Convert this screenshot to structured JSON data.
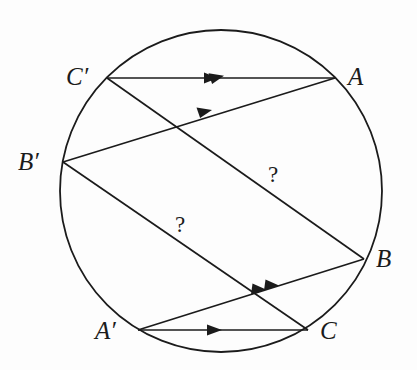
{
  "figure": {
    "background_color": "#fdfdfd",
    "stroke_color": "#1b1b1b",
    "circle": {
      "name": "circumscribed-circle",
      "cx": 221,
      "cy": 191,
      "r": 161,
      "stroke_width": 1.8
    },
    "points": [
      {
        "id": "A",
        "label": "A",
        "x": 335,
        "y": 78,
        "label_x": 348,
        "label_y": 64
      },
      {
        "id": "B",
        "label": "B",
        "x": 364,
        "y": 259,
        "label_x": 376,
        "label_y": 246
      },
      {
        "id": "C",
        "label": "C",
        "x": 308,
        "y": 330,
        "label_x": 320,
        "label_y": 318
      },
      {
        "id": "Ap",
        "label": "A′",
        "x": 138,
        "y": 330,
        "label_x": 95,
        "label_y": 318
      },
      {
        "id": "Bp",
        "label": "B′",
        "x": 63,
        "y": 162,
        "label_x": 18,
        "label_y": 149
      },
      {
        "id": "Cp",
        "label": "C′",
        "x": 107,
        "y": 78,
        "label_x": 66,
        "label_y": 64
      }
    ],
    "segments": [
      {
        "id": "seg-Cp-A",
        "from": "C′",
        "to": "A",
        "x1": 107,
        "y1": 78,
        "x2": 335,
        "y2": 78,
        "arrows": 1,
        "arrow_at": {
          "x": 218,
          "y": 78
        }
      },
      {
        "id": "seg-Bp-A",
        "from": "B′",
        "to": "A",
        "x1": 63,
        "y1": 162,
        "x2": 335,
        "y2": 78,
        "arrows": 2,
        "arrow_at": {
          "x": 220,
          "y": 110
        }
      },
      {
        "id": "seg-Cp-B",
        "from": "C′",
        "to": "B",
        "x1": 107,
        "y1": 78,
        "x2": 364,
        "y2": 259,
        "arrows": 0,
        "label": "?"
      },
      {
        "id": "seg-Bp-C",
        "from": "B′",
        "to": "C",
        "x1": 63,
        "y1": 162,
        "x2": 308,
        "y2": 330,
        "arrows": 0,
        "label": "?"
      },
      {
        "id": "seg-Ap-B",
        "from": "A′",
        "to": "B",
        "x1": 138,
        "y1": 330,
        "x2": 364,
        "y2": 259,
        "arrows": 2,
        "arrow_at": {
          "x": 272,
          "y": 288
        }
      },
      {
        "id": "seg-Ap-C",
        "from": "A′",
        "to": "C",
        "x1": 138,
        "y1": 330,
        "x2": 308,
        "y2": 330,
        "arrows": 1,
        "arrow_at": {
          "x": 218,
          "y": 330
        }
      }
    ],
    "annotations": [
      {
        "id": "q1",
        "text": "?",
        "x": 268,
        "y": 163
      },
      {
        "id": "q2",
        "text": "?",
        "x": 175,
        "y": 213
      }
    ]
  }
}
